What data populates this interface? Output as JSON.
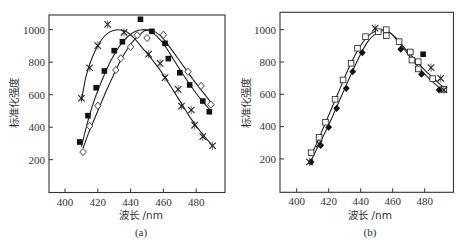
{
  "chart_data": [
    {
      "type": "scatter",
      "panel_label": "(a)",
      "title": "",
      "xlabel": "波长 /nm",
      "ylabel": "标准化强度",
      "xlim": [
        390,
        498
      ],
      "ylim": [
        0,
        1100
      ],
      "xticks": [
        400,
        420,
        440,
        460,
        480
      ],
      "yticks": [
        200,
        400,
        600,
        800,
        1000
      ],
      "grid": false,
      "legend": null,
      "series": [
        {
          "name": "cross",
          "marker": "x",
          "points": [
            [
              410,
              578
            ],
            [
              415,
              766
            ],
            [
              420,
              902
            ],
            [
              426,
              1033
            ],
            [
              436,
              984
            ],
            [
              451,
              850
            ],
            [
              458,
              793
            ],
            [
              461,
              705
            ],
            [
              469,
              633
            ],
            [
              471,
              530
            ],
            [
              477,
              506
            ],
            [
              479,
              413
            ],
            [
              484,
              342
            ],
            [
              490,
              286
            ]
          ],
          "curve": [
            [
              410,
              560
            ],
            [
              413,
              720
            ],
            [
              417,
              840
            ],
            [
              422,
              935
            ],
            [
              427,
              985
            ],
            [
              432,
              1000
            ],
            [
              437,
              990
            ],
            [
              442,
              950
            ],
            [
              447,
              890
            ],
            [
              452,
              830
            ],
            [
              457,
              765
            ],
            [
              462,
              690
            ],
            [
              467,
              610
            ],
            [
              472,
              530
            ],
            [
              477,
              450
            ],
            [
              482,
              380
            ],
            [
              487,
              320
            ],
            [
              490,
              285
            ]
          ]
        },
        {
          "name": "filled-square",
          "marker": "square-filled",
          "points": [
            [
              409,
              309
            ],
            [
              414,
              471
            ],
            [
              419,
              643
            ],
            [
              424,
              746
            ],
            [
              430,
              871
            ],
            [
              435,
              926
            ],
            [
              446,
              1064
            ],
            [
              453,
              990
            ],
            [
              461,
              916
            ],
            [
              463,
              822
            ],
            [
              470,
              735
            ],
            [
              476,
              660
            ],
            [
              484,
              561
            ],
            [
              488,
              495
            ]
          ],
          "curve": [
            [
              410,
              280
            ],
            [
              414,
              440
            ],
            [
              418,
              570
            ],
            [
              423,
              700
            ],
            [
              428,
              810
            ],
            [
              433,
              895
            ],
            [
              438,
              955
            ],
            [
              443,
              990
            ],
            [
              447,
              1000
            ],
            [
              451,
              995
            ],
            [
              456,
              960
            ],
            [
              461,
              900
            ],
            [
              466,
              820
            ],
            [
              471,
              740
            ],
            [
              476,
              665
            ],
            [
              481,
              595
            ],
            [
              486,
              535
            ],
            [
              489,
              500
            ]
          ]
        },
        {
          "name": "open-diamond",
          "marker": "diamond-open",
          "points": [
            [
              411,
              247
            ],
            [
              415,
              407
            ],
            [
              420,
              532
            ],
            [
              431,
              752
            ],
            [
              434,
              824
            ],
            [
              440,
              894
            ],
            [
              444,
              966
            ],
            [
              450,
              949
            ],
            [
              460,
              969
            ],
            [
              475,
              741
            ],
            [
              483,
              654
            ],
            [
              489,
              539
            ]
          ],
          "curve": [
            [
              411,
              270
            ],
            [
              415,
              380
            ],
            [
              420,
              500
            ],
            [
              425,
              620
            ],
            [
              430,
              730
            ],
            [
              435,
              830
            ],
            [
              440,
              910
            ],
            [
              445,
              965
            ],
            [
              449,
              995
            ],
            [
              453,
              995
            ],
            [
              458,
              965
            ],
            [
              463,
              905
            ],
            [
              468,
              835
            ],
            [
              473,
              765
            ],
            [
              478,
              695
            ],
            [
              483,
              630
            ],
            [
              488,
              565
            ],
            [
              490,
              530
            ]
          ]
        }
      ]
    },
    {
      "type": "scatter",
      "panel_label": "(b)",
      "title": "",
      "xlabel": "波长 /nm",
      "ylabel": "标准化强度",
      "xlim": [
        390,
        497
      ],
      "ylim": [
        0,
        1100
      ],
      "xticks": [
        400,
        420,
        440,
        460,
        480
      ],
      "yticks": [
        200,
        400,
        600,
        800,
        1000
      ],
      "grid": false,
      "legend": null,
      "series": [
        {
          "name": "open-square",
          "marker": "square-open",
          "points": [
            [
              409,
              238
            ],
            [
              414,
              334
            ],
            [
              418,
              427
            ],
            [
              424,
              569
            ],
            [
              429,
              689
            ],
            [
              434,
              792
            ],
            [
              438,
              885
            ],
            [
              443,
              957
            ],
            [
              451,
              988
            ],
            [
              456,
              1000
            ],
            [
              456,
              963
            ],
            [
              464,
              926
            ],
            [
              471,
              862
            ],
            [
              472,
              812
            ],
            [
              476,
              802
            ],
            [
              476,
              757
            ],
            [
              485,
              697
            ],
            [
              492,
              631
            ]
          ]
        },
        {
          "name": "filled-diamond",
          "marker": "diamond-filled",
          "points": [
            [
              409,
              181
            ],
            [
              415,
              284
            ],
            [
              420,
              396
            ],
            [
              425,
              513
            ],
            [
              431,
              637
            ],
            [
              435,
              740
            ],
            [
              441,
              858
            ],
            [
              465,
              879
            ],
            [
              478,
              724
            ],
            [
              489,
              627
            ]
          ]
        },
        {
          "name": "cross",
          "marker": "x",
          "points": [
            [
              408,
              181
            ],
            [
              414,
              292
            ],
            [
              449,
              1009
            ],
            [
              484,
              765
            ],
            [
              490,
              699
            ],
            [
              492,
              627
            ]
          ]
        },
        {
          "name": "filled-square",
          "marker": "square-filled",
          "points": [
            [
              479,
              848
            ]
          ]
        }
      ],
      "curves": [
        {
          "name": "upper-fit",
          "points": [
            [
              409,
              220
            ],
            [
              414,
              330
            ],
            [
              420,
              470
            ],
            [
              426,
              610
            ],
            [
              432,
              750
            ],
            [
              438,
              870
            ],
            [
              444,
              955
            ],
            [
              449,
              990
            ],
            [
              454,
              1000
            ],
            [
              458,
              985
            ],
            [
              463,
              940
            ],
            [
              468,
              880
            ],
            [
              474,
              815
            ],
            [
              480,
              750
            ],
            [
              486,
              695
            ],
            [
              492,
              640
            ]
          ]
        },
        {
          "name": "lower-fit",
          "points": [
            [
              409,
              190
            ],
            [
              414,
              290
            ],
            [
              420,
              410
            ],
            [
              426,
              545
            ],
            [
              432,
              680
            ],
            [
              438,
              810
            ],
            [
              444,
              920
            ],
            [
              450,
              980
            ],
            [
              455,
              995
            ],
            [
              459,
              975
            ],
            [
              464,
              920
            ],
            [
              469,
              855
            ],
            [
              475,
              780
            ],
            [
              481,
              715
            ],
            [
              487,
              660
            ],
            [
              492,
              615
            ]
          ]
        }
      ]
    }
  ],
  "panels": [
    {
      "label": "(a)",
      "xlabel": "波长 /nm",
      "ylabel": "标准化强度",
      "xticks": [
        "400",
        "420",
        "440",
        "460",
        "480"
      ],
      "yticks": [
        "200",
        "400",
        "600",
        "800",
        "1000"
      ]
    },
    {
      "label": "(b)",
      "xlabel": "波长 /nm",
      "ylabel": "标准化强度",
      "xticks": [
        "400",
        "420",
        "440",
        "460",
        "480"
      ],
      "yticks": [
        "200",
        "400",
        "600",
        "800",
        "1000"
      ]
    }
  ]
}
